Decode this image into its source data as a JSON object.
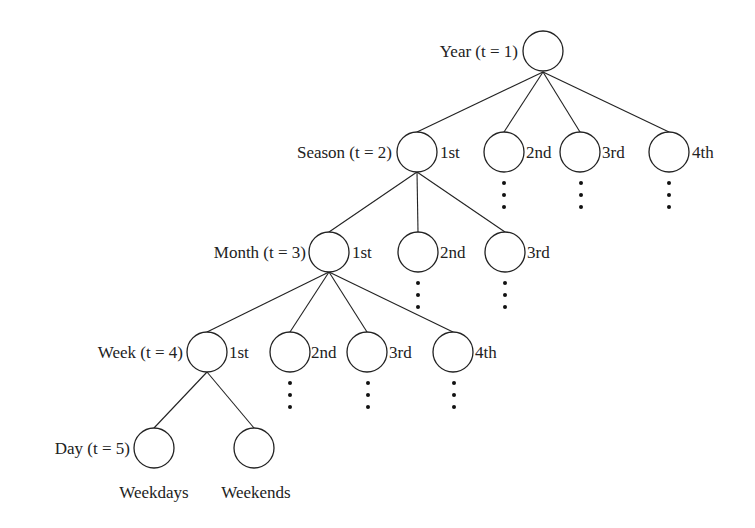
{
  "diagram": {
    "type": "hierarchical-tree",
    "levels": [
      {
        "name": "Year",
        "label": "Year (t = 1)",
        "nodes": [
          ""
        ]
      },
      {
        "name": "Season",
        "label": "Season (t = 2)",
        "nodes": [
          "1st",
          "2nd",
          "3rd",
          "4th"
        ]
      },
      {
        "name": "Month",
        "label": "Month (t = 3)",
        "nodes": [
          "1st",
          "2nd",
          "3rd"
        ]
      },
      {
        "name": "Week",
        "label": "Week (t = 4)",
        "nodes": [
          "1st",
          "2nd",
          "3rd",
          "4th"
        ]
      },
      {
        "name": "Day",
        "label": "Day (t = 5)",
        "nodes": [
          "Weekdays",
          "Weekends"
        ]
      }
    ]
  },
  "year": {
    "label": "Year (t = 1)"
  },
  "season": {
    "label": "Season (t = 2)",
    "n1": "1st",
    "n2": "2nd",
    "n3": "3rd",
    "n4": "4th"
  },
  "month": {
    "label": "Month (t = 3)",
    "n1": "1st",
    "n2": "2nd",
    "n3": "3rd"
  },
  "week": {
    "label": "Week (t = 4)",
    "n1": "1st",
    "n2": "2nd",
    "n3": "3rd",
    "n4": "4th"
  },
  "day": {
    "label": "Day (t = 5)",
    "n1": "Weekdays",
    "n2": "Weekends"
  },
  "ellipsis": "⋮"
}
